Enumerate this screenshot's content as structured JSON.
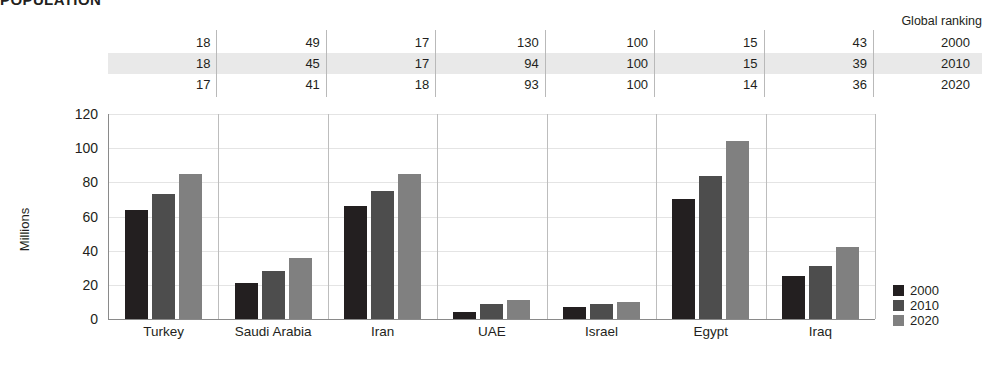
{
  "title": "POPULATION",
  "ranking": {
    "header": "Global ranking",
    "years": [
      "2000",
      "2010",
      "2020"
    ],
    "highlight_row_index": 1,
    "highlight_color": "#e9e9e9",
    "rows": [
      {
        "year": "2000",
        "values": [
          "18",
          "49",
          "17",
          "130",
          "100",
          "15",
          "43"
        ]
      },
      {
        "year": "2010",
        "values": [
          "18",
          "45",
          "17",
          "94",
          "100",
          "15",
          "39"
        ]
      },
      {
        "year": "2020",
        "values": [
          "17",
          "41",
          "18",
          "93",
          "100",
          "14",
          "36"
        ]
      }
    ]
  },
  "legend": {
    "items": [
      {
        "label": "2000",
        "color": "#231f20"
      },
      {
        "label": "2010",
        "color": "#4d4d4d"
      },
      {
        "label": "2020",
        "color": "#808080"
      }
    ]
  },
  "chart_data": {
    "type": "bar",
    "title": "POPULATION",
    "xlabel": "",
    "ylabel": "Millions",
    "ylim": [
      0,
      120
    ],
    "yticks": [
      0,
      20,
      40,
      60,
      80,
      100,
      120
    ],
    "grid": true,
    "legend_position": "right",
    "categories": [
      "Turkey",
      "Saudi Arabia",
      "Iran",
      "UAE",
      "Israel",
      "Egypt",
      "Iraq"
    ],
    "series": [
      {
        "name": "2000",
        "color": "#231f20",
        "values": [
          64,
          21,
          66,
          4,
          7,
          70,
          25
        ]
      },
      {
        "name": "2010",
        "color": "#4d4d4d",
        "values": [
          73,
          28,
          75,
          9,
          9,
          84,
          31
        ]
      },
      {
        "name": "2020",
        "color": "#808080",
        "values": [
          85,
          36,
          85,
          11,
          10,
          104,
          42
        ]
      }
    ]
  }
}
